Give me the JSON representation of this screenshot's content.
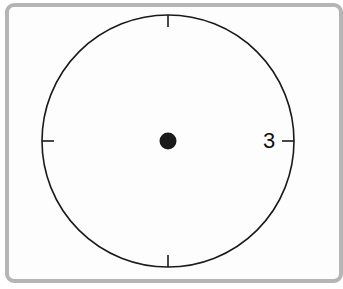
{
  "diagram": {
    "type": "clock-face",
    "hands": "none",
    "numerals": [
      {
        "position": 3,
        "text": "3"
      }
    ],
    "tick_marks": [
      12,
      3,
      6,
      9
    ],
    "center_dot": true,
    "colors": {
      "stroke": "#1a1a1a",
      "panel_border": "#b5b5b5",
      "background": "#ffffff"
    }
  }
}
